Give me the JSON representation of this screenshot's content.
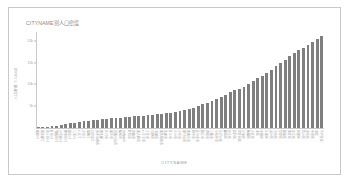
{
  "chart_data": {
    "type": "bar",
    "title": "CITYNAME別人口密度",
    "xlabel": "CITYNAME",
    "ylabel": "人口密度（人/km2）",
    "grid": false,
    "legend": "none",
    "ylim": [
      0,
      22000
    ],
    "yticks": [
      5000,
      10000,
      15000,
      20000
    ],
    "ytick_labels": [
      "5k",
      "10k",
      "15k",
      "20k"
    ],
    "categories": [
      "檜原村",
      "奥多摩町",
      "青ヶ島村",
      "利島村",
      "御蔵島村",
      "小笠原村",
      "神津島村",
      "新島村",
      "三宅村",
      "八丈町",
      "大島町",
      "瑞穂町",
      "日の出町",
      "あきる野市",
      "奥多摩",
      "羽村市",
      "福生市",
      "武蔵村山市",
      "稲城市",
      "multipoint",
      "昭島市",
      "青梅市",
      "東大和市",
      "八王子市",
      "町田市",
      "日野市",
      "清瀬市",
      "東久留米市",
      "多摩市",
      "国立市",
      "立川市",
      "小平市",
      "東村山市",
      "西東京市",
      "府中市",
      "国分寺市",
      "狛江市",
      "調布市",
      "三鷹市",
      "小金井市",
      "江戸川区",
      "練馬区",
      "足立区",
      "葛飾区",
      "世田谷区",
      "杉並区",
      "板橋区",
      "大田区",
      "北区",
      "中野区",
      "江東区",
      "品川区",
      "渋谷区",
      "目黒区",
      "新宿区",
      "墨田区",
      "文京区",
      "台東区",
      "荒川区",
      "豊島区",
      "中央区",
      "港区",
      "千代田区"
    ],
    "values": [
      120,
      180,
      280,
      380,
      480,
      700,
      900,
      1050,
      1200,
      1350,
      1500,
      1650,
      1780,
      1900,
      2000,
      2100,
      2200,
      2300,
      2400,
      2480,
      2560,
      2640,
      2720,
      2800,
      2900,
      3000,
      3100,
      3250,
      3400,
      3550,
      3750,
      3950,
      4150,
      4400,
      4700,
      5000,
      5400,
      5800,
      6200,
      6600,
      7100,
      7600,
      8200,
      8600,
      9000,
      9500,
      10200,
      10800,
      11400,
      12000,
      12700,
      13400,
      14200,
      15000,
      15600,
      16400,
      17200,
      17900,
      18400,
      19000,
      19600,
      20400,
      21200
    ]
  }
}
